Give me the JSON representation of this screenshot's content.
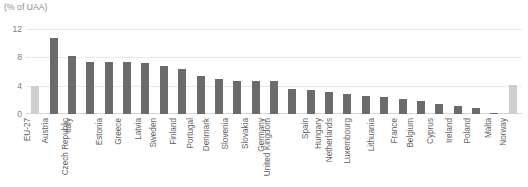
{
  "chart_data": {
    "type": "bar",
    "title": "",
    "subtitle": "",
    "unit_label": "(% of UAA)",
    "xlabel": "",
    "ylabel": "",
    "ylim": [
      0,
      12
    ],
    "yticks": [
      0,
      4,
      8,
      12
    ],
    "ytick_labels": [
      "0",
      "4",
      "8",
      "12"
    ],
    "grid": true,
    "legend": "none",
    "categories": [
      "EU-27",
      "Austria",
      "Italy",
      "Czech Republic",
      "Estonia",
      "Greece",
      "Latvia",
      "Sweden",
      "Finland",
      "Portugal",
      "Denmark",
      "Slovenia",
      "Slovakia",
      "Germany",
      "United Kingdom",
      "Spain",
      "Hungary",
      "Netherlands",
      "Luxembourg",
      "Lithuania",
      "France",
      "Belgium",
      "Cyprus",
      "Ireland",
      "Poland",
      "Malta",
      "Norway"
    ],
    "values": [
      3.9,
      10.8,
      8.2,
      7.4,
      7.3,
      7.3,
      7.2,
      6.8,
      6.3,
      5.4,
      4.9,
      4.7,
      4.7,
      4.6,
      3.6,
      3.4,
      3.1,
      2.8,
      2.5,
      2.4,
      2.1,
      1.8,
      1.4,
      1.1,
      0.8,
      0.2,
      4.1
    ],
    "series_name": "Share of organic area",
    "highlight_categories": [
      "EU-27",
      "Norway"
    ],
    "colors": {
      "bar": "#6b6b6b",
      "bar_highlight": "#cfcfcf",
      "gridline": "#e9e9e9",
      "axis_text": "#7d7d7d",
      "label_text": "#5f5f5f",
      "unit_text": "#8a8a8a",
      "background": "#ffffff"
    }
  }
}
